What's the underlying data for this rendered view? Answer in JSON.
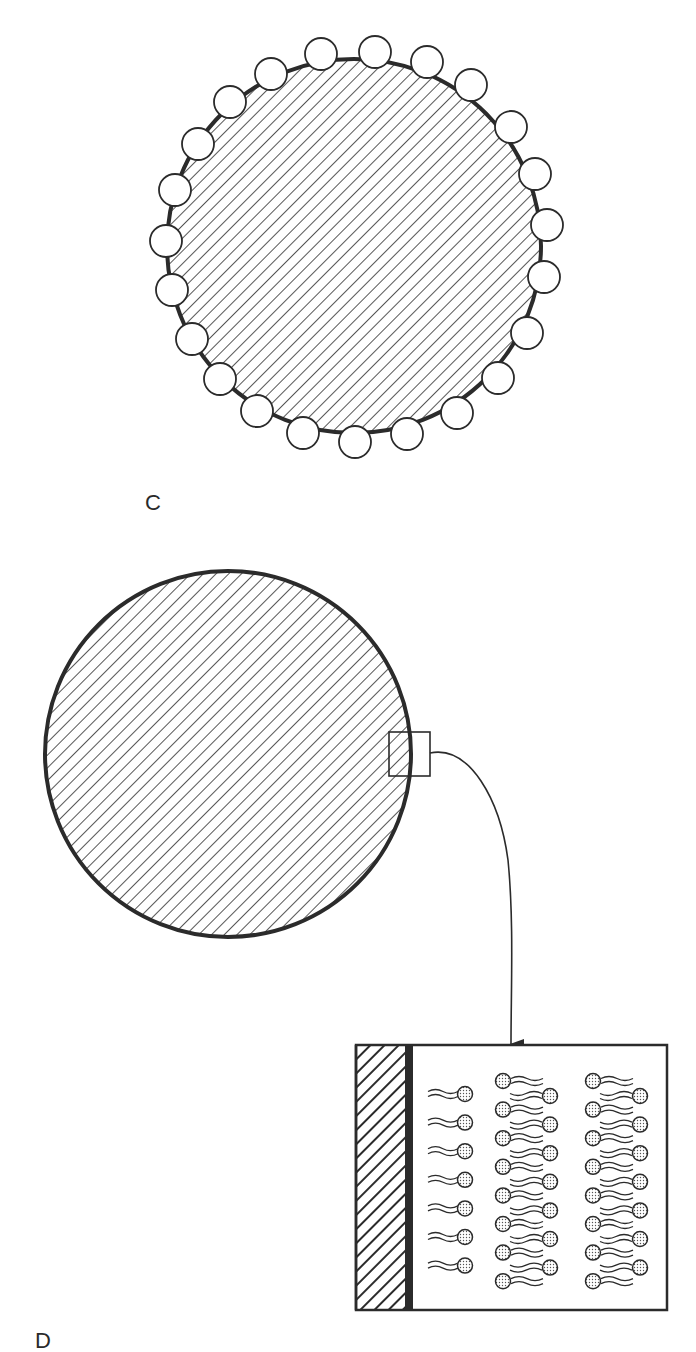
{
  "labels": {
    "panel_c": "C",
    "panel_d": "D"
  },
  "colors": {
    "ink": "#2b2b2b",
    "background": "#ffffff",
    "head_fill": "#e2e2e2"
  },
  "top_particle": {
    "description": "Hatched particle surrounded by a single layer of adsorbed spheres",
    "center": [
      354,
      246
    ],
    "radius": 187,
    "bead_radius": 16,
    "beads": [
      [
        321,
        54
      ],
      [
        375,
        52
      ],
      [
        427,
        62
      ],
      [
        471,
        85
      ],
      [
        511,
        127
      ],
      [
        535,
        174
      ],
      [
        547,
        225
      ],
      [
        544,
        277
      ],
      [
        527,
        333
      ],
      [
        498,
        378
      ],
      [
        457,
        413
      ],
      [
        407,
        434
      ],
      [
        355,
        442
      ],
      [
        303,
        433
      ],
      [
        257,
        411
      ],
      [
        220,
        379
      ],
      [
        192,
        339
      ],
      [
        172,
        290
      ],
      [
        166,
        241
      ],
      [
        175,
        190
      ],
      [
        198,
        144
      ],
      [
        230,
        102
      ],
      [
        271,
        74
      ]
    ]
  },
  "bottom_particle": {
    "description": "Hatched particle with magnified surface region",
    "center": [
      228,
      754
    ],
    "radius": 183,
    "inset_box": {
      "x": 389,
      "y": 732,
      "w": 41,
      "h": 44
    }
  },
  "detail_box": {
    "description": "Magnified surface showing surfactant monolayer and bilayers",
    "x": 356,
    "y": 1045,
    "w": 311,
    "h": 265,
    "hatched_strip_width": 49,
    "surface_bar_width": 8,
    "monolayer_rows": 7,
    "bilayer_columns": 2,
    "bilayer_rows": 8
  }
}
